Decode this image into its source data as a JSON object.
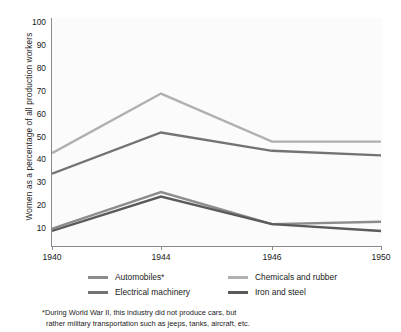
{
  "chart_data": {
    "type": "line",
    "title": "",
    "xlabel": "",
    "ylabel": "Women as a percentage of all production workers",
    "x": [
      1940,
      1944,
      1946,
      1950
    ],
    "xtick_labels": [
      "1940",
      "1944",
      "1946",
      "1950"
    ],
    "ytick_labels": [
      "10",
      "20",
      "30",
      "40",
      "50",
      "60",
      "70",
      "80",
      "90",
      "100"
    ],
    "ylim": [
      0,
      100
    ],
    "ytick_step": 10,
    "grid": false,
    "legend_position": "below-axes",
    "series": [
      {
        "name": "Automobiles*",
        "color": "#8c8c8c",
        "values": [
          8,
          24,
          10,
          11
        ]
      },
      {
        "name": "Electrical machinery",
        "color": "#737373",
        "values": [
          32,
          50,
          42,
          40
        ]
      },
      {
        "name": "Chemicals and rubber",
        "color": "#b0b0b0",
        "values": [
          41,
          67,
          46,
          46
        ]
      },
      {
        "name": "Iron and steel",
        "color": "#5a5a5a",
        "values": [
          7,
          22,
          10,
          7
        ]
      }
    ],
    "footnote_lines": [
      "*During World War II, this industry did not produce cars, but",
      "rather military transportation such as jeeps, tanks, aircraft, etc."
    ]
  },
  "axis": {
    "line_color": "#8a8a8a",
    "plot_background": "#fbfbfb"
  }
}
